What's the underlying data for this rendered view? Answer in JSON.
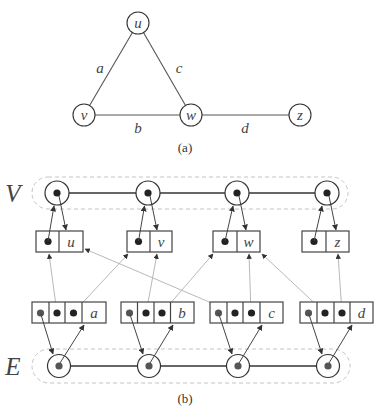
{
  "figure_a": {
    "vertices": {
      "u": "u",
      "v": "v",
      "w": "w",
      "z": "z"
    },
    "edges": {
      "a": "a",
      "b": "b",
      "c": "c",
      "d": "d"
    },
    "caption": "(a)"
  },
  "figure_b": {
    "vertex_set_label": "V",
    "edge_set_label": "E",
    "vertex_boxes": [
      "u",
      "v",
      "w",
      "z"
    ],
    "edge_boxes": [
      "a",
      "b",
      "c",
      "d"
    ],
    "caption": "(b)"
  }
}
